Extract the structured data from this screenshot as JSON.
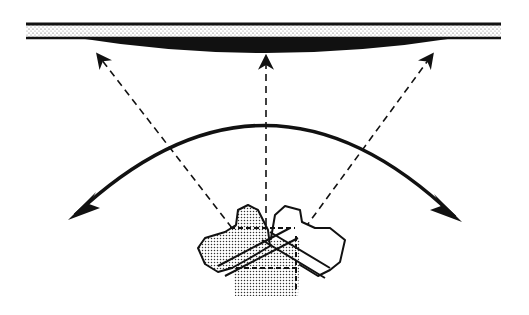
{
  "diagram": {
    "colors": {
      "ink": "#111111",
      "background": "#ffffff",
      "stipple": "#555555"
    },
    "elements": {
      "surface_layer": "stippled-band",
      "deposit": "black-lens",
      "beams": [
        "left-beam",
        "center-beam",
        "right-beam"
      ],
      "sweep": "double-headed-arc-arrow",
      "device": "rotating-transducer-positions"
    }
  }
}
